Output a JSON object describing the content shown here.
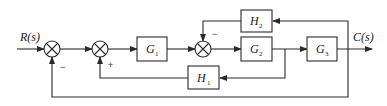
{
  "diagram": {
    "type": "control-system-block-diagram",
    "input_label": "R(s)",
    "output_label": "C(s)",
    "blocks": [
      {
        "id": "G1",
        "letter": "G",
        "subscript": "1",
        "role": "forward"
      },
      {
        "id": "G2",
        "letter": "G",
        "subscript": "2",
        "role": "forward"
      },
      {
        "id": "G3",
        "letter": "G",
        "subscript": "3",
        "role": "forward"
      },
      {
        "id": "H1",
        "letter": "H",
        "subscript": "1",
        "role": "feedback"
      },
      {
        "id": "H2",
        "letter": "H",
        "subscript": "2",
        "role": "feedback"
      }
    ],
    "summing_junctions": [
      {
        "id": "S1",
        "feedback_sign": "−",
        "feedback_from": "C(s) (unity outer loop)"
      },
      {
        "id": "S2",
        "feedback_sign": "+",
        "feedback_from": "H1"
      },
      {
        "id": "S3",
        "feedback_sign": "−",
        "feedback_from": "H2"
      }
    ],
    "signs": {
      "s1_feedback": "−",
      "s2_feedback": "+",
      "s3_feedback": "−"
    },
    "connections": [
      "R(s) → S1",
      "S1 → S2",
      "S2 → G1",
      "G1 → S3",
      "S3 → G2",
      "G2 → G3",
      "G3 → C(s)",
      "G2 output → H1 → S2 (+)",
      "C(s) → H2 → S3 (−)",
      "C(s) → S1 (−) unity feedback"
    ]
  }
}
